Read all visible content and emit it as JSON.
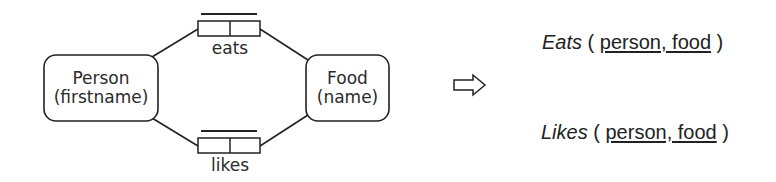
{
  "diagram": {
    "entities": [
      {
        "id": "person",
        "name": "Person",
        "key": "(firstname)"
      },
      {
        "id": "food",
        "name": "Food",
        "key": "(name)"
      }
    ],
    "relationships": [
      {
        "id": "eats",
        "label": "eats",
        "from": "person",
        "to": "food"
      },
      {
        "id": "likes",
        "label": "likes",
        "from": "person",
        "to": "food"
      }
    ],
    "arrow": "⇨",
    "relations": [
      {
        "name": "Eats",
        "open": " ( ",
        "keys": "person, food",
        "close": " )"
      },
      {
        "name": "Likes",
        "open": " ( ",
        "keys": "person, food",
        "close": " )"
      }
    ]
  },
  "colors": {
    "stroke": "#222222",
    "text": "#2a2a2a",
    "background": "#ffffff"
  }
}
